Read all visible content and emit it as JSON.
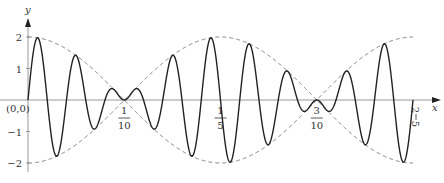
{
  "chart_data": {
    "type": "line",
    "title": "",
    "xlabel": "x",
    "ylabel": "y",
    "origin_label": "(0,0)",
    "xlim": [
      0,
      0.4
    ],
    "ylim": [
      -2,
      2
    ],
    "x_ticks": [
      {
        "value": 0.1,
        "num": "1",
        "den": "10"
      },
      {
        "value": 0.2,
        "num": "1",
        "den": "5"
      },
      {
        "value": 0.3,
        "num": "3",
        "den": "10"
      },
      {
        "value": 0.4,
        "num": "2",
        "den": "5"
      }
    ],
    "y_ticks": [
      {
        "value": 2,
        "label": "2"
      },
      {
        "value": 1,
        "label": "1"
      },
      {
        "value": -1,
        "label": "−1"
      },
      {
        "value": -2,
        "label": "−2"
      }
    ],
    "series": [
      {
        "name": "y = 2cos(5πx)·sin(50πx)",
        "style": "solid",
        "color": "#222222",
        "amplitude": 2,
        "envelope_freq": 2.5,
        "carrier_freq": 25
      },
      {
        "name": "envelope +2cos(5πx)",
        "style": "dashed",
        "color": "#777777"
      },
      {
        "name": "envelope −2cos(5πx)",
        "style": "dashed",
        "color": "#777777"
      }
    ],
    "grid": false,
    "legend": "none"
  },
  "layout": {
    "origin_px": [
      28,
      100
    ],
    "px_per_x": 962.5,
    "px_per_y": 31.5,
    "x_end_px": 440
  }
}
